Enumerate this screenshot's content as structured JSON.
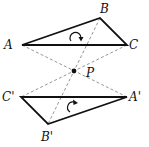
{
  "figure": {
    "points": {
      "A": {
        "label": "A",
        "x": 22,
        "y": 45
      },
      "B": {
        "label": "B",
        "x": 100,
        "y": 18
      },
      "C": {
        "label": "C",
        "x": 127,
        "y": 45
      },
      "P": {
        "label": "P",
        "x": 74,
        "y": 71
      },
      "A_prime": {
        "label": "A'",
        "x": 127,
        "y": 97
      },
      "B_prime": {
        "label": "B'",
        "x": 48,
        "y": 124
      },
      "C_prime": {
        "label": "C'",
        "x": 21,
        "y": 97
      }
    },
    "rotation_arrows": [
      {
        "name": "rotation-arrow-top",
        "direction": "clockwise",
        "cx": 76,
        "cy": 37
      },
      {
        "name": "rotation-arrow-bottom",
        "direction": "clockwise",
        "cx": 71,
        "cy": 107
      }
    ],
    "colors": {
      "triangle_stroke": "#111111",
      "dashed_lines": "#8a8a8a",
      "background": "#ffffff"
    }
  }
}
